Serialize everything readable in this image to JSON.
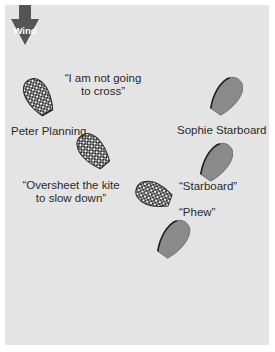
{
  "diagram": {
    "wind": {
      "label": "Wind",
      "direction": "down",
      "color": "#555555"
    },
    "colors": {
      "panel_background": "#e4e4e4",
      "port_boat_pattern": "checkered",
      "starboard_boat_fill": "#8a8a8a",
      "boat_outline": "#2b2b2b",
      "text": "#2a2a2a"
    },
    "boats": [
      {
        "id": "peter-1",
        "sailor": "Peter Planning",
        "tack": "port",
        "style": "checkered"
      },
      {
        "id": "peter-2",
        "sailor": "Peter Planning",
        "tack": "port",
        "style": "checkered"
      },
      {
        "id": "peter-3",
        "sailor": "Peter Planning",
        "tack": "port",
        "style": "checkered"
      },
      {
        "id": "sophie-1",
        "sailor": "Sophie Starboard",
        "tack": "starboard",
        "style": "solid"
      },
      {
        "id": "sophie-2",
        "sailor": "Sophie Starboard",
        "tack": "starboard",
        "style": "solid"
      },
      {
        "id": "sophie-3",
        "sailor": "Sophie Starboard",
        "tack": "starboard",
        "style": "solid"
      }
    ],
    "labels": {
      "quote_not_cross_line1": "“I am not going",
      "quote_not_cross_line2": "to cross”",
      "peter_name": "Peter Planning",
      "sophie_name": "Sophie Starboard",
      "quote_oversheet_line1": "“Oversheet the kite",
      "quote_oversheet_line2": "to slow down”",
      "quote_starboard": "“Starboard”",
      "quote_phew": "“Phew”"
    }
  }
}
